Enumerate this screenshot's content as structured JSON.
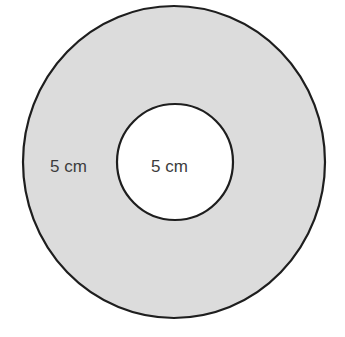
{
  "diagram": {
    "type": "annulus",
    "colors": {
      "ring_fill": "#dcdcdc",
      "inner_fill": "#ffffff",
      "stroke": "#1e1e1e",
      "text": "#3c3c3c"
    },
    "outer_circle": {
      "cx": 174,
      "cy": 162,
      "rx": 151,
      "ry": 156
    },
    "inner_circle": {
      "cx": 175,
      "cy": 162,
      "r": 58
    },
    "labels": {
      "ring_width": "5 cm",
      "inner_radius": "5 cm"
    }
  }
}
